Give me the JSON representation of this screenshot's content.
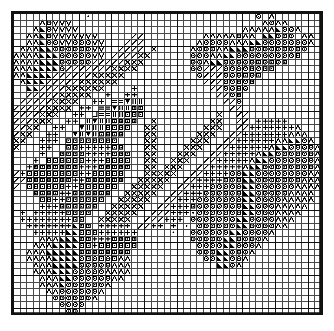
{
  "document": {
    "type": "cross-stitch-chart",
    "title": "Cross Stitch Pattern Chart",
    "description": "Monochrome counted cross-stitch / needlepoint grid chart depicting a rose and leaves motif rendered with stitch symbols."
  },
  "grid": {
    "columns": 47,
    "rows": 46,
    "cell_size_px": 6.55,
    "heavy_line_every": 5,
    "light_line_color": "#4a4a4a",
    "heavy_line_color": "#111111",
    "border_color": "#111111",
    "background_color": "#ffffff",
    "symbol_color": "#000000",
    "origin_x_px": 11,
    "origin_y_px": 11,
    "width_px": 312,
    "height_px": 304
  },
  "symbol_key": [
    {
      "id": "A",
      "glyph": "caret-up",
      "name": "caret-up-symbol",
      "description": "Open chevron / caret pointing up"
    },
    {
      "id": "V",
      "glyph": "caret-down",
      "name": "caret-down-symbol",
      "description": "Open chevron / caret pointing down"
    },
    {
      "id": "O",
      "glyph": "circle-dot",
      "name": "circle-dot-symbol",
      "description": "Ring with centre dot"
    },
    {
      "id": "T",
      "glyph": "triangle-filled",
      "name": "filled-triangle-symbol",
      "description": "Solid filled right triangle"
    },
    {
      "id": "D",
      "glyph": "triangle-down-filled",
      "name": "filled-down-triangle-symbol",
      "description": "Solid downward triangle"
    },
    {
      "id": "S",
      "glyph": "slash",
      "name": "slash-symbol",
      "description": "Diagonal stroke rising left to right"
    },
    {
      "id": "X",
      "glyph": "cross-x",
      "name": "cross-x-symbol",
      "description": "Diagonal cross / saltire"
    },
    {
      "id": "P",
      "glyph": "plus",
      "name": "plus-symbol",
      "description": "Upright plus sign"
    },
    {
      "id": "Q",
      "glyph": "square-dot",
      "name": "square-dot-symbol",
      "description": "Small square outline with centre dot"
    },
    {
      "id": "E",
      "glyph": "equals",
      "name": "equals-symbol",
      "description": "Two horizontal bars"
    },
    {
      "id": "B",
      "glyph": "bars",
      "name": "vertical-bars-symbol",
      "description": "Two or three vertical bars"
    },
    {
      "id": "U",
      "glyph": "u-shape",
      "name": "u-shape-symbol",
      "description": "U shaped stroke"
    },
    {
      "id": "d",
      "glyph": "dot",
      "name": "dot-symbol",
      "description": "Single centre dot"
    }
  ],
  "chart_data": {
    "type": "heatmap",
    "title": "Cross Stitch Pattern Chart",
    "xlabel": "",
    "ylabel": "",
    "grid": true,
    "legend": "none",
    "categories": [],
    "rows": [
      "...........d.........................O.A.......",
      "....AOVVV.............................AOAA.....",
      "...ATOVVVV.........................AAAAATOOA...",
      "..AATOVVVVVVV.....SS...+.....AAAAAOAA.TTOOO.AA.",
      "..AATOOVVOOOVV...SSS..++...+AOOOOAAATTOOOOOOOA.",
      ".AAATTOOOOOOVV..SSSS.X++..+AOOOAATTTOOOOOOOOO..",
      "AAAATTTOOOOOVV.SSSSXX++..++OOOAATTOOOOOOOOOQ...",
      "AAAATTTOOOOOSSSSSXXX++...++OOATTOOOOOQOQOQ.....",
      "AAATTTTOSSSSSSSXXXX+++....+OOSSSOOOOQOQQ.......",
      "AATTTTSSSSSSXXXXX+++++.....+OSSSOOOQOQ.........",
      ".ATTTSSSSSXXXXXX++++++......+SSSOOQOQ..........",
      "..TTSSSSXXXXXX++++P++........+SSOOQO...........",
      "..SSSSSXXXXX++P++PP++.........+SSOQ............",
      ".SSSSSXXXX++PP+EEDBB+..........+SSO............",
      "SSSSSXXXX+PP+EEDBBQQ+..........++SS............",
      "SSSSXXX++PP+UEEBBQQQ++.........X++SS...........",
      "SSSXXX++PP+BDBBQQQQ++X........XX++SS.PPPPP.....",
      "SSXX++PP++DBBBQQQQ++XX.......XXX++SSPPPPPPPA...",
      "SXX++PP++DBDBQQQQ+++XX......XXX++SSPPPPPPPAAA..",
      "XX++PPP+QQQQQQQQ++++XX.....XXX++SSPPPPPPAATTOA.",
      "X+++PP++QQPPPPPQQ+++XX....XXX++SSPPPPPPATTOOOOA",
      "++++P++QQQQPPPPQQQ++XX...XXX++SSPPPPPATTOOOOOOA",
      ".++P+QQQQQQPPPQQQQ++XX..XXX++SSPPPPPATTOOOOOOOA",
      ".+PQQQQQQQPPPQQQQQ++XX.XXX++SSPPPPPATTOOOOOOOOA",
      "SPQQQQQQQQPPQQQQQ+++XXXXX++SSPPPPOOTTOOOOOOOOAA",
      "SSQQQQQQQPPQQQQQQ++XXXXX++SSPPPPOOOTTOOOOOOOAAA",
      "S+QQQQQQPPQQQQQQ++XXXXX++SSPPPOOOOOTTOOOOOOAAAA",
      ".++QQQQPPQQQQQQ++XXXXX++SSPPPOOOOOOTTOOOOOAAAA.",
      "..++QQPPQQQQQQ++XXXXX++SSPPPOOOOOOOTTOOOOAAAAA.",
      "+..+PPPQQQQQQ++XXXXX++SSPPPQOOOOOOOTTOOOAAAAA..",
      ".P+PPPPPQQQQ++XXXXX++SSSPPPdOOOOOOOTTOOOAAAA...",
      ".PPPPPPPPQQ++XXXXX++SSSPPP.OOOOOOOTTOOOOAAA....",
      "..PPPPPPPTQQ+PPPPP+SSPP+P.d.OOOOOOTTOOOOAA.....",
      "...PPPPPTTQQQPPPPPP.....d..OOOOOOTTOOOOA.......",
      "....AAATTTQQPPPQQQQ........OOOOOTTOOOOA........",
      "...AAATTTTQQPQQQQQQ.........OOOOTTOOOA.........",
      "..AAATTTTTQQQQQQQQ..........OOOTTOOOA..........",
      "..AAAATTTTOQOQOQAA...........OOTTOOA...........",
      "...AAATTTTOOOOOAAA.............TTOA............",
      "...AAATTTOOOOOAAAA.............................",
      "....AAATTOOOOOOAA..............................",
      "....AAATOOOOOOA................................",
      ".....AAOOOOOOA.................................",
      "......OOOOOOA..................................",
      ".......OOOO....................................",
      "........OO....................................."
    ]
  }
}
